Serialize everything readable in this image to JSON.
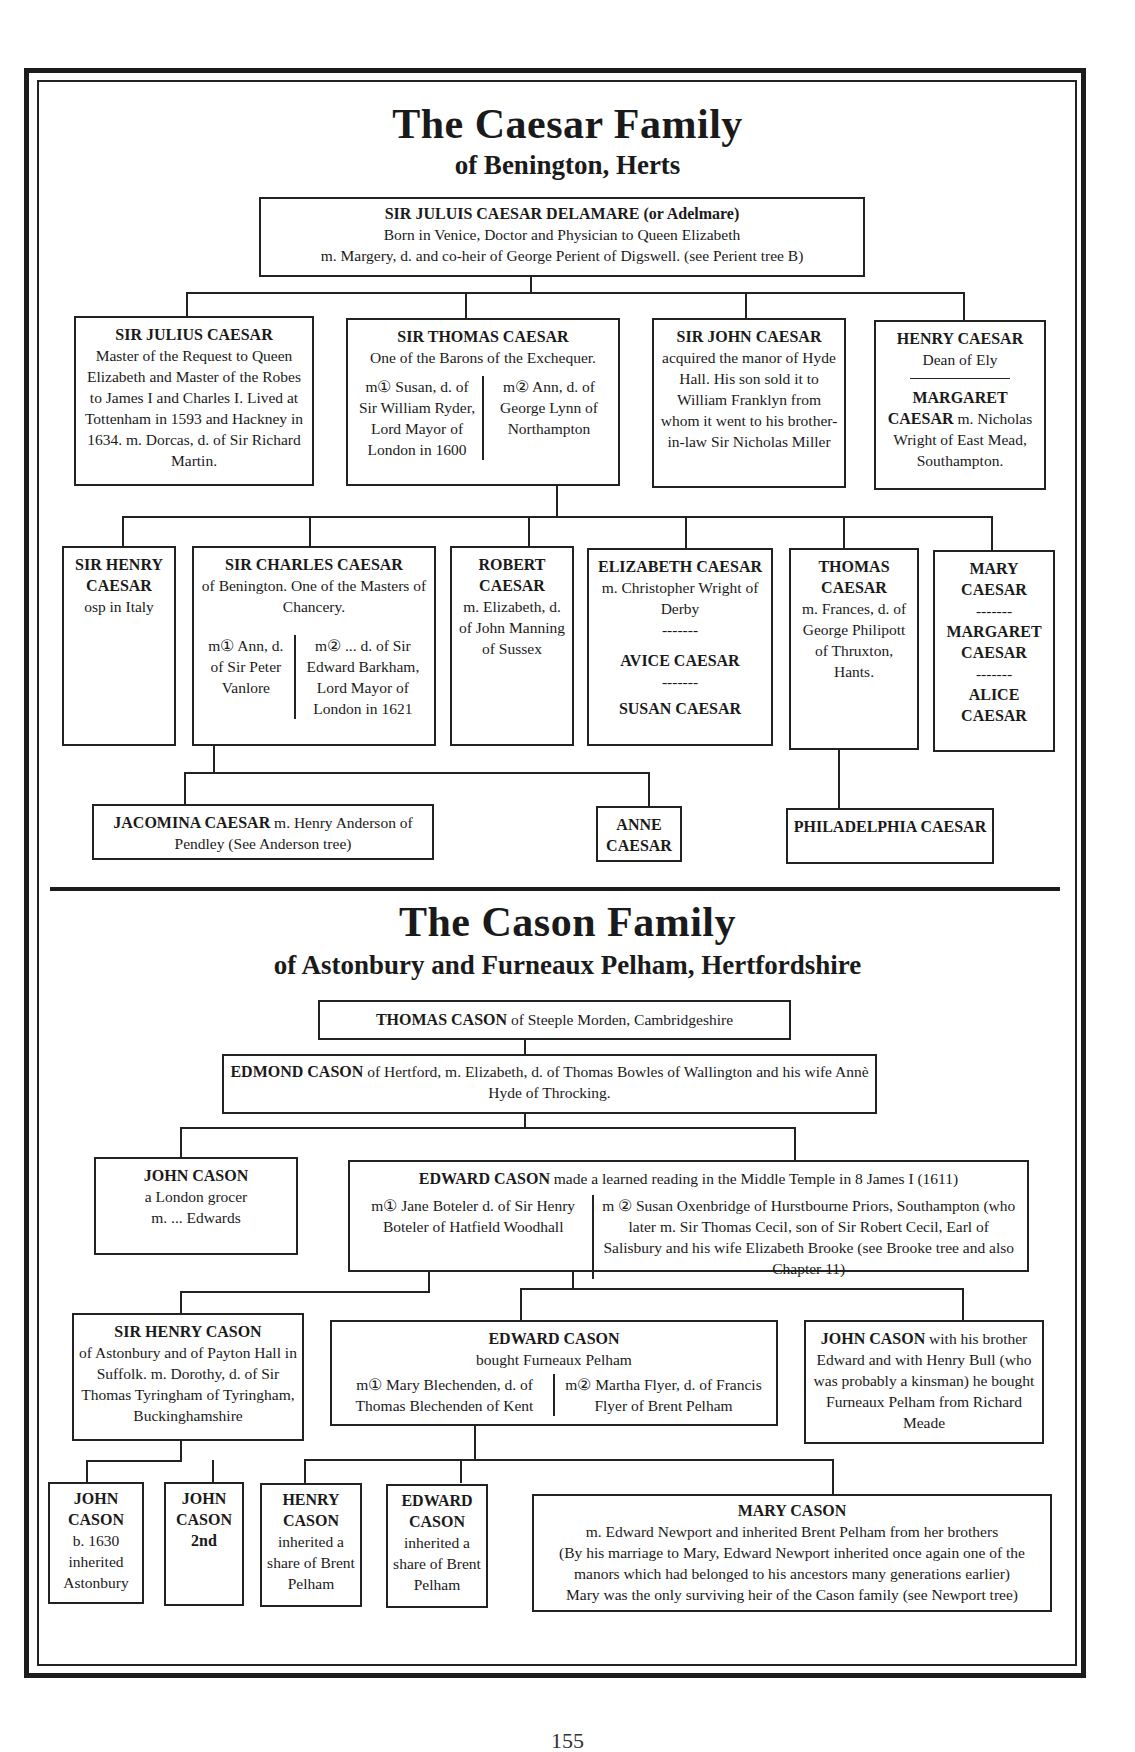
{
  "caesar": {
    "title": "The Caesar Family",
    "subtitle": "of Benington, Herts",
    "root": {
      "name": "SIR JULUIS CAESAR DELAMARE (or Adelmare)",
      "line1": "Born in Venice, Doctor and Physician to Queen Elizabeth",
      "line2": "m. Margery, d. and co-heir of George Perient of Digswell. (see Perient tree B)"
    },
    "gen2": {
      "julius": {
        "name": "SIR JULIUS CAESAR",
        "text": "Master of the Request to Queen Elizabeth and Master of the Robes to James I and Charles I. Lived at Tottenham in 1593 and Hackney in 1634. m. Dorcas, d. of Sir Richard Martin."
      },
      "thomas": {
        "name": "SIR THOMAS CAESAR",
        "text": "One of the Barons of the Exchequer.",
        "m1": "m① Susan, d. of Sir William Ryder, Lord Mayor of London in 1600",
        "m2": "m② Ann, d. of George Lynn of Northampton"
      },
      "john": {
        "name": "SIR JOHN CAESAR",
        "text": "acquired the manor of Hyde Hall. His son sold it to William Franklyn from whom it went to his brother-in-law Sir Nicholas Miller"
      },
      "henry": {
        "name": "HENRY CAESAR",
        "text": "Dean of Ely",
        "name2": "MARGARET CAESAR",
        "text2": "m. Nicholas Wright of East Mead, Southampton."
      }
    },
    "gen3": {
      "henry": {
        "name": "SIR HENRY CAESAR",
        "text": "osp in Italy"
      },
      "charles": {
        "name": "SIR CHARLES CAESAR",
        "text": "of Benington. One of the Masters of Chancery.",
        "m1": "m① Ann, d. of Sir Peter Vanlore",
        "m2": "m② ... d. of Sir Edward Barkham, Lord Mayor of London in 1621"
      },
      "robert": {
        "name": "ROBERT CAESAR",
        "text": "m. Elizabeth, d. of John Manning of Sussex"
      },
      "elizabeth": {
        "name": "ELIZABETH CAESAR",
        "text": "m. Christopher Wright of Derby",
        "sep": "-------",
        "name2": "AVICE CAESAR",
        "sep2": "-------",
        "name3": "SUSAN CAESAR"
      },
      "thomas": {
        "name": "THOMAS CAESAR",
        "text": "m. Frances, d. of George Philipott of Thruxton, Hants."
      },
      "mary": {
        "name": "MARY CAESAR",
        "sep": "-------",
        "name2": "MARGARET CAESAR",
        "sep2": "-------",
        "name3": "ALICE CAESAR"
      }
    },
    "gen4": {
      "jacomina": {
        "name": "JACOMINA CAESAR",
        "text": "m. Henry Anderson of Pendley (See Anderson tree)"
      },
      "anne": {
        "name": "ANNE CAESAR"
      },
      "philadelphia": {
        "name": "PHILADELPHIA CAESAR"
      }
    }
  },
  "cason": {
    "title": "The Cason Family",
    "subtitle": "of Astonbury and Furneaux Pelham, Hertfordshire",
    "thomas": {
      "name": "THOMAS CASON",
      "text": "of Steeple Morden, Cambridgeshire"
    },
    "edmond": {
      "name": "EDMOND CASON",
      "text": "of Hertford, m. Elizabeth, d. of Thomas Bowles of Wallington and his wife Annè Hyde of Throcking."
    },
    "john1": {
      "name": "JOHN CASON",
      "text1": "a London grocer",
      "text2": "m. ... Edwards"
    },
    "edward1": {
      "name": "EDWARD CASON",
      "text": "made a learned reading in the Middle Temple in 8 James I (1611)",
      "m1": "m① Jane Boteler d. of Sir Henry Boteler of Hatfield Woodhall",
      "m2": "m ② Susan Oxenbridge of Hurstbourne Priors, Southampton (who later m. Sir Thomas Cecil, son of Sir Robert Cecil, Earl of Salisbury and his wife Elizabeth Brooke (see Brooke tree and also Chapter 11)"
    },
    "henry": {
      "name": "SIR HENRY CASON",
      "text": "of Astonbury and of Payton Hall in Suffolk. m. Dorothy, d. of Sir Thomas Tyringham of Tyringham, Buckinghamshire"
    },
    "edward2": {
      "name": "EDWARD CASON",
      "text": "bought Furneaux Pelham",
      "m1": "m① Mary Blechenden, d. of Thomas Blechenden of Kent",
      "m2": "m② Martha Flyer, d. of Francis Flyer of Brent Pelham"
    },
    "john2": {
      "name": "JOHN CASON",
      "text": "with his brother Edward and with Henry Bull (who was probably a kinsman) he bought Furneaux Pelham from Richard Meade"
    },
    "gen5": {
      "john_a": {
        "name": "JOHN CASON",
        "text": "b. 1630 inherited Astonbury"
      },
      "john_b": {
        "name": "JOHN CASON",
        "text": "2nd"
      },
      "henry": {
        "name": "HENRY CASON",
        "text": "inherited a share of Brent Pelham"
      },
      "edward": {
        "name": "EDWARD CASON",
        "text": "inherited a share of Brent Pelham"
      },
      "mary": {
        "name": "MARY CASON",
        "line1": "m. Edward Newport and inherited Brent Pelham from her brothers",
        "line2": "(By his marriage to Mary, Edward Newport inherited once again one of the manors which had belonged to his ancestors many generations earlier)",
        "line3": "Mary was the only surviving heir of the Cason family (see Newport tree)"
      }
    }
  },
  "page_number": "155"
}
